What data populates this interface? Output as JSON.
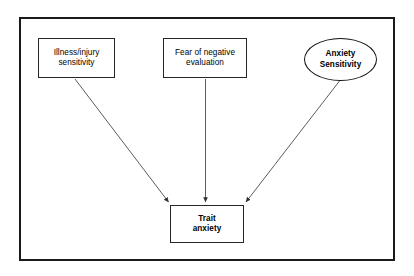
{
  "diagram": {
    "frame": {
      "border_color": "#1a1a1a",
      "background": "#ffffff"
    },
    "nodes": [
      {
        "id": "illness-injury-sensitivity",
        "label": "Illness/injury\nsensitivity",
        "shape": "rectangle",
        "bold": false
      },
      {
        "id": "fear-of-negative-evaluation",
        "label": "Fear of negative\nevaluation",
        "shape": "rectangle",
        "bold": false
      },
      {
        "id": "anxiety-sensitivity",
        "label": "Anxiety\nSensitivity",
        "shape": "ellipse",
        "bold": true
      },
      {
        "id": "trait-anxiety",
        "label": "Trait\nanxiety",
        "shape": "rectangle",
        "bold": true
      }
    ],
    "edges": [
      {
        "id": "illness-to-trait",
        "from": "illness-injury-sensitivity",
        "to": "trait-anxiety",
        "style": "solid-arrow",
        "label": ""
      },
      {
        "id": "fear-to-trait",
        "from": "fear-of-negative-evaluation",
        "to": "trait-anxiety",
        "style": "solid-arrow",
        "label": ""
      },
      {
        "id": "anxiety-sensitivity-to-trait",
        "from": "anxiety-sensitivity",
        "to": "trait-anxiety",
        "style": "solid-arrow",
        "label": ""
      }
    ],
    "colors": {
      "line": "#404040",
      "node_border": "#262626",
      "text": "#000000"
    }
  }
}
